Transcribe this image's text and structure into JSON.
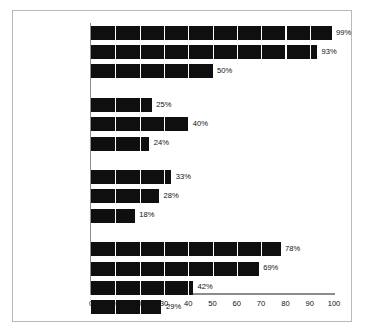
{
  "chart_data": {
    "type": "bar",
    "orientation": "horizontal",
    "title": "",
    "subtitle": "",
    "xlabel": "",
    "ylabel": "",
    "xlim": [
      0,
      100
    ],
    "xticks": [
      0,
      10,
      20,
      30,
      40,
      50,
      60,
      70,
      80,
      90,
      100
    ],
    "tick_labels": [
      "0",
      "10",
      "20",
      "30",
      "40",
      "50",
      "60",
      "70",
      "80",
      "90",
      "100"
    ],
    "grid": "vertical-white-separators-on-bars",
    "legend": "none",
    "value_suffix": "%",
    "bar_color": "#100f0f",
    "axis_color": "#8c8c8c",
    "categories": [
      "A television",
      "VCR/DVD player",
      "Video\ngame player",
      "Large-screen TV\n(40\" or more)",
      "Surround sound",
      "Four or\nmore TVs",
      "Portable\nDVD player",
      "Handheld\nvideo game",
      "TV or DVD\nin car",
      "Computer",
      "Internet access",
      "High-speed\naccess",
      "Two or more\ncomputers"
    ],
    "values": [
      99,
      93,
      50,
      25,
      40,
      24,
      33,
      28,
      18,
      78,
      69,
      42,
      29
    ],
    "value_labels": [
      "99%",
      "93%",
      "50%",
      "25%",
      "40%",
      "24%",
      "33%",
      "28%",
      "18%",
      "78%",
      "69%",
      "42%",
      "29%"
    ],
    "groups": [
      {
        "name": "television",
        "indices": [
          0,
          1,
          2
        ]
      },
      {
        "name": "home-theater",
        "indices": [
          3,
          4,
          5
        ]
      },
      {
        "name": "portable",
        "indices": [
          6,
          7,
          8
        ]
      },
      {
        "name": "computing",
        "indices": [
          9,
          10,
          11,
          12
        ]
      }
    ]
  }
}
